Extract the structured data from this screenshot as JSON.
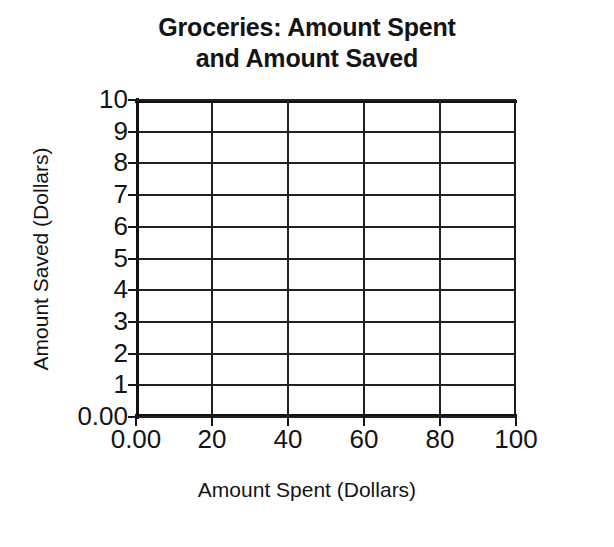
{
  "chart_data": {
    "type": "scatter",
    "title": "Groceries: Amount Spent and Amount Saved",
    "title_lines": [
      "Groceries: Amount Spent",
      "and Amount Saved"
    ],
    "xlabel": "Amount Spent (Dollars)",
    "ylabel": "Amount Saved (Dollars)",
    "x_tick_labels": [
      "0.00",
      "20",
      "40",
      "60",
      "80",
      "100"
    ],
    "x_tick_values": [
      0,
      20,
      40,
      60,
      80,
      100
    ],
    "y_tick_labels": [
      "0.00",
      "1",
      "2",
      "3",
      "4",
      "5",
      "6",
      "7",
      "8",
      "9",
      "10"
    ],
    "y_tick_values": [
      0,
      1,
      2,
      3,
      4,
      5,
      6,
      7,
      8,
      9,
      10
    ],
    "xlim": [
      0,
      100
    ],
    "ylim": [
      0,
      10
    ],
    "grid": true,
    "legend": "none",
    "series": [],
    "values": [],
    "annotations": [],
    "note": "Empty coordinate grid; no data points are plotted."
  },
  "colors": {
    "background": "#ffffff",
    "ink": "#141414",
    "gridline": "#202020",
    "axis": "#111111"
  }
}
